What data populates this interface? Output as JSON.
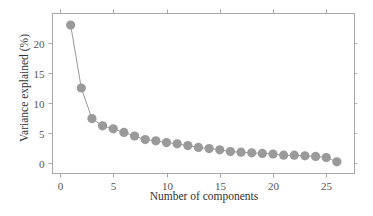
{
  "chart_data": {
    "type": "line",
    "title": "",
    "xlabel": "Number of components",
    "ylabel": "Variance explained (%)",
    "x": [
      1,
      2,
      3,
      4,
      5,
      6,
      7,
      8,
      9,
      10,
      11,
      12,
      13,
      14,
      15,
      16,
      17,
      18,
      19,
      20,
      21,
      22,
      23,
      24,
      25,
      26
    ],
    "series": [
      {
        "name": "Variance explained",
        "values": [
          23.0,
          12.5,
          7.4,
          6.2,
          5.7,
          5.1,
          4.5,
          3.9,
          3.7,
          3.4,
          3.2,
          2.9,
          2.6,
          2.4,
          2.2,
          1.9,
          1.8,
          1.7,
          1.6,
          1.5,
          1.3,
          1.3,
          1.2,
          1.1,
          0.9,
          0.2
        ],
        "marker": "circle",
        "color": "#9a9a9a",
        "line_color": "#8c8c8c"
      }
    ],
    "xticks": [
      0,
      5,
      10,
      15,
      20,
      25
    ],
    "yticks": [
      0,
      5,
      10,
      15,
      20
    ],
    "xlim": [
      -0.7,
      27.7
    ],
    "ylim": [
      -1.7,
      25
    ],
    "grid": false,
    "legend": null
  },
  "axes": {
    "x_label": "Number of components",
    "y_label": "Variance explained (%)",
    "x_tick_labels": [
      "0",
      "5",
      "10",
      "15",
      "20",
      "25"
    ],
    "y_tick_labels": [
      "0",
      "5",
      "10",
      "15",
      "20"
    ]
  }
}
